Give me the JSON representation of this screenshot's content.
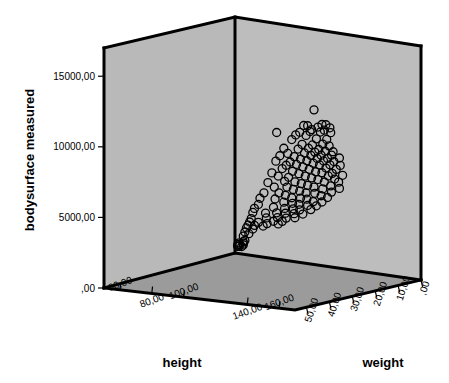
{
  "chart_data": {
    "type": "scatter",
    "title": "",
    "subtitle": "",
    "projection": "3d",
    "xlabel": "height",
    "ylabel": "weight",
    "zlabel": "bodysurface measured",
    "axes": {
      "x": {
        "name": "height",
        "tick_labels": [
          "60,00",
          "80,00",
          "100,00",
          "140,00",
          "160,00"
        ],
        "tick_values": [
          60,
          80,
          100,
          140,
          160
        ],
        "range": [
          50,
          170
        ],
        "label_rotation_deg": -20,
        "staggered": true
      },
      "y": {
        "name": "weight",
        "tick_labels": [
          "50,00",
          "40,00",
          "30,00",
          "20,00",
          "10,00",
          ",00"
        ],
        "tick_values": [
          50,
          40,
          30,
          20,
          10,
          0
        ],
        "range": [
          55,
          0
        ],
        "label_rotation_deg": -72
      },
      "z": {
        "name": "bodysurface measured",
        "tick_labels": [
          "15000,00",
          "10000,00",
          "5000,00",
          ",00"
        ],
        "tick_values": [
          15000,
          10000,
          5000,
          0
        ],
        "range": [
          0,
          17000
        ],
        "label_rotation_deg": 0
      }
    },
    "grid": false,
    "legend": null,
    "marker": {
      "shape": "open-circle",
      "radius_px": 4,
      "stroke": "#000000",
      "fill": "none"
    },
    "colors": {
      "left_wall": "#b9b9b9",
      "right_wall": "#bdbdbd",
      "floor": "#9b9b9b",
      "frame": "#000000",
      "text": "#000000",
      "background": "#ffffff"
    },
    "n_points": 149,
    "points": [
      {
        "height": 158,
        "weight": 39,
        "bodysurface": 13300
      },
      {
        "height": 151,
        "weight": 50,
        "bodysurface": 12100
      },
      {
        "height": 156,
        "weight": 42,
        "bodysurface": 12300
      },
      {
        "height": 157,
        "weight": 41,
        "bodysurface": 12250
      },
      {
        "height": 160,
        "weight": 37,
        "bodysurface": 12200
      },
      {
        "height": 161,
        "weight": 36,
        "bodysurface": 12150
      },
      {
        "height": 159,
        "weight": 38,
        "bodysurface": 12050
      },
      {
        "height": 158,
        "weight": 40,
        "bodysurface": 11950
      },
      {
        "height": 162,
        "weight": 35,
        "bodysurface": 11900
      },
      {
        "height": 155,
        "weight": 43,
        "bodysurface": 11850
      },
      {
        "height": 157,
        "weight": 40,
        "bodysurface": 11800
      },
      {
        "height": 160,
        "weight": 36,
        "bodysurface": 11750
      },
      {
        "height": 154,
        "weight": 44,
        "bodysurface": 11700
      },
      {
        "height": 159,
        "weight": 37,
        "bodysurface": 11650
      },
      {
        "height": 156,
        "weight": 41,
        "bodysurface": 11550
      },
      {
        "height": 161,
        "weight": 34,
        "bodysurface": 11500
      },
      {
        "height": 153,
        "weight": 45,
        "bodysurface": 11400
      },
      {
        "height": 158,
        "weight": 38,
        "bodysurface": 11200
      },
      {
        "height": 160,
        "weight": 35,
        "bodysurface": 11050
      },
      {
        "height": 155,
        "weight": 42,
        "bodysurface": 10950
      },
      {
        "height": 151,
        "weight": 47,
        "bodysurface": 10850
      },
      {
        "height": 157,
        "weight": 39,
        "bodysurface": 10800
      },
      {
        "height": 159,
        "weight": 36,
        "bodysurface": 10750
      },
      {
        "height": 154,
        "weight": 43,
        "bodysurface": 10650
      },
      {
        "height": 156,
        "weight": 40,
        "bodysurface": 10600
      },
      {
        "height": 160,
        "weight": 34,
        "bodysurface": 10550
      },
      {
        "height": 152,
        "weight": 46,
        "bodysurface": 10450
      },
      {
        "height": 158,
        "weight": 37,
        "bodysurface": 10400
      },
      {
        "height": 150,
        "weight": 48,
        "bodysurface": 10350
      },
      {
        "height": 155,
        "weight": 41,
        "bodysurface": 10300
      },
      {
        "height": 157,
        "weight": 38,
        "bodysurface": 10250
      },
      {
        "height": 159,
        "weight": 35,
        "bodysurface": 10200
      },
      {
        "height": 153,
        "weight": 44,
        "bodysurface": 10150
      },
      {
        "height": 161,
        "weight": 33,
        "bodysurface": 10100
      },
      {
        "height": 156,
        "weight": 39,
        "bodysurface": 10050
      },
      {
        "height": 149,
        "weight": 49,
        "bodysurface": 10000
      },
      {
        "height": 158,
        "weight": 36,
        "bodysurface": 9950
      },
      {
        "height": 154,
        "weight": 42,
        "bodysurface": 9900
      },
      {
        "height": 160,
        "weight": 33,
        "bodysurface": 9850
      },
      {
        "height": 152,
        "weight": 45,
        "bodysurface": 9800
      },
      {
        "height": 157,
        "weight": 37,
        "bodysurface": 9750
      },
      {
        "height": 155,
        "weight": 40,
        "bodysurface": 9700
      },
      {
        "height": 159,
        "weight": 34,
        "bodysurface": 9650
      },
      {
        "height": 151,
        "weight": 46,
        "bodysurface": 9600
      },
      {
        "height": 162,
        "weight": 31,
        "bodysurface": 9580
      },
      {
        "height": 153,
        "weight": 43,
        "bodysurface": 9550
      },
      {
        "height": 158,
        "weight": 35,
        "bodysurface": 9500
      },
      {
        "height": 156,
        "weight": 38,
        "bodysurface": 9450
      },
      {
        "height": 150,
        "weight": 47,
        "bodysurface": 9400
      },
      {
        "height": 160,
        "weight": 32,
        "bodysurface": 9350
      },
      {
        "height": 154,
        "weight": 41,
        "bodysurface": 9300
      },
      {
        "height": 157,
        "weight": 36,
        "bodysurface": 9250
      },
      {
        "height": 148,
        "weight": 50,
        "bodysurface": 9200
      },
      {
        "height": 159,
        "weight": 33,
        "bodysurface": 9150
      },
      {
        "height": 152,
        "weight": 44,
        "bodysurface": 9100
      },
      {
        "height": 155,
        "weight": 39,
        "bodysurface": 9050
      },
      {
        "height": 161,
        "weight": 30,
        "bodysurface": 9000
      },
      {
        "height": 158,
        "weight": 34,
        "bodysurface": 8950
      },
      {
        "height": 149,
        "weight": 48,
        "bodysurface": 8900
      },
      {
        "height": 153,
        "weight": 42,
        "bodysurface": 8850
      },
      {
        "height": 156,
        "weight": 37,
        "bodysurface": 8800
      },
      {
        "height": 160,
        "weight": 31,
        "bodysurface": 8750
      },
      {
        "height": 151,
        "weight": 45,
        "bodysurface": 8700
      },
      {
        "height": 157,
        "weight": 35,
        "bodysurface": 8650
      },
      {
        "height": 154,
        "weight": 40,
        "bodysurface": 8600
      },
      {
        "height": 147,
        "weight": 51,
        "bodysurface": 8550
      },
      {
        "height": 159,
        "weight": 32,
        "bodysurface": 8500
      },
      {
        "height": 150,
        "weight": 46,
        "bodysurface": 8450
      },
      {
        "height": 155,
        "weight": 38,
        "bodysurface": 8400
      },
      {
        "height": 158,
        "weight": 33,
        "bodysurface": 8350
      },
      {
        "height": 152,
        "weight": 43,
        "bodysurface": 8300
      },
      {
        "height": 161,
        "weight": 29,
        "bodysurface": 8250
      },
      {
        "height": 156,
        "weight": 36,
        "bodysurface": 8200
      },
      {
        "height": 148,
        "weight": 49,
        "bodysurface": 8150
      },
      {
        "height": 153,
        "weight": 41,
        "bodysurface": 8100
      },
      {
        "height": 159,
        "weight": 31,
        "bodysurface": 8050
      },
      {
        "height": 150,
        "weight": 45,
        "bodysurface": 8000
      },
      {
        "height": 157,
        "weight": 34,
        "bodysurface": 7950
      },
      {
        "height": 154,
        "weight": 39,
        "bodysurface": 7900
      },
      {
        "height": 146,
        "weight": 52,
        "bodysurface": 7850
      },
      {
        "height": 160,
        "weight": 30,
        "bodysurface": 7800
      },
      {
        "height": 151,
        "weight": 43,
        "bodysurface": 7750
      },
      {
        "height": 155,
        "weight": 37,
        "bodysurface": 7700
      },
      {
        "height": 148,
        "weight": 47,
        "bodysurface": 7650
      },
      {
        "height": 158,
        "weight": 32,
        "bodysurface": 7600
      },
      {
        "height": 152,
        "weight": 41,
        "bodysurface": 7550
      },
      {
        "height": 145,
        "weight": 53,
        "bodysurface": 7500
      },
      {
        "height": 156,
        "weight": 34,
        "bodysurface": 7450
      },
      {
        "height": 149,
        "weight": 45,
        "bodysurface": 7400
      },
      {
        "height": 153,
        "weight": 39,
        "bodysurface": 7350
      },
      {
        "height": 159,
        "weight": 29,
        "bodysurface": 7300
      },
      {
        "height": 147,
        "weight": 48,
        "bodysurface": 7250
      },
      {
        "height": 154,
        "weight": 36,
        "bodysurface": 7200
      },
      {
        "height": 150,
        "weight": 43,
        "bodysurface": 7150
      },
      {
        "height": 157,
        "weight": 31,
        "bodysurface": 7100
      },
      {
        "height": 144,
        "weight": 53,
        "bodysurface": 7050
      },
      {
        "height": 151,
        "weight": 40,
        "bodysurface": 7000
      },
      {
        "height": 155,
        "weight": 34,
        "bodysurface": 6950
      },
      {
        "height": 148,
        "weight": 45,
        "bodysurface": 6900
      },
      {
        "height": 152,
        "weight": 38,
        "bodysurface": 6850
      },
      {
        "height": 143,
        "weight": 54,
        "bodysurface": 6800
      },
      {
        "height": 156,
        "weight": 32,
        "bodysurface": 6750
      },
      {
        "height": 149,
        "weight": 42,
        "bodysurface": 6700
      },
      {
        "height": 146,
        "weight": 48,
        "bodysurface": 6650
      },
      {
        "height": 153,
        "weight": 36,
        "bodysurface": 6600
      },
      {
        "height": 150,
        "weight": 40,
        "bodysurface": 6550
      },
      {
        "height": 142,
        "weight": 54,
        "bodysurface": 6500
      },
      {
        "height": 154,
        "weight": 33,
        "bodysurface": 6450
      },
      {
        "height": 147,
        "weight": 44,
        "bodysurface": 6400
      },
      {
        "height": 151,
        "weight": 37,
        "bodysurface": 6350
      },
      {
        "height": 144,
        "weight": 50,
        "bodysurface": 6300
      },
      {
        "height": 148,
        "weight": 41,
        "bodysurface": 6250
      },
      {
        "height": 152,
        "weight": 34,
        "bodysurface": 6200
      },
      {
        "height": 145,
        "weight": 46,
        "bodysurface": 6150
      },
      {
        "height": 149,
        "weight": 39,
        "bodysurface": 6100
      },
      {
        "height": 141,
        "weight": 54,
        "bodysurface": 6050
      },
      {
        "height": 146,
        "weight": 43,
        "bodysurface": 6000
      },
      {
        "height": 150,
        "weight": 35,
        "bodysurface": 5950
      },
      {
        "height": 143,
        "weight": 49,
        "bodysurface": 5900
      },
      {
        "height": 147,
        "weight": 40,
        "bodysurface": 5850
      },
      {
        "height": 140,
        "weight": 54,
        "bodysurface": 5800
      },
      {
        "height": 144,
        "weight": 45,
        "bodysurface": 5750
      },
      {
        "height": 148,
        "weight": 37,
        "bodysurface": 5700
      },
      {
        "height": 141,
        "weight": 51,
        "bodysurface": 5650
      },
      {
        "height": 145,
        "weight": 42,
        "bodysurface": 5600
      },
      {
        "height": 139,
        "weight": 54,
        "bodysurface": 5560
      },
      {
        "height": 143,
        "weight": 46,
        "bodysurface": 5530
      },
      {
        "height": 146,
        "weight": 39,
        "bodysurface": 5500
      },
      {
        "height": 140,
        "weight": 52,
        "bodysurface": 5470
      },
      {
        "height": 142,
        "weight": 48,
        "bodysurface": 5440
      },
      {
        "height": 144,
        "weight": 43,
        "bodysurface": 5400
      },
      {
        "height": 138,
        "weight": 54,
        "bodysurface": 5350
      },
      {
        "height": 141,
        "weight": 49,
        "bodysurface": 5300
      },
      {
        "height": 143,
        "weight": 44,
        "bodysurface": 5250
      },
      {
        "height": 139,
        "weight": 52,
        "bodysurface": 5200
      },
      {
        "height": 137,
        "weight": 54,
        "bodysurface": 5050
      },
      {
        "height": 138,
        "weight": 53,
        "bodysurface": 4900
      },
      {
        "height": 136,
        "weight": 54,
        "bodysurface": 4750
      },
      {
        "height": 137,
        "weight": 54,
        "bodysurface": 4450
      },
      {
        "height": 136,
        "weight": 54,
        "bodysurface": 4350
      },
      {
        "height": 135,
        "weight": 55,
        "bodysurface": 4300
      },
      {
        "height": 136,
        "weight": 54,
        "bodysurface": 4250
      },
      {
        "height": 135,
        "weight": 55,
        "bodysurface": 4200
      },
      {
        "height": 134,
        "weight": 55,
        "bodysurface": 4150
      },
      {
        "height": 136,
        "weight": 54,
        "bodysurface": 4120
      },
      {
        "height": 135,
        "weight": 55,
        "bodysurface": 4080
      },
      {
        "height": 134,
        "weight": 55,
        "bodysurface": 4040
      },
      {
        "height": 135,
        "weight": 54,
        "bodysurface": 4000
      }
    ]
  },
  "geometry": {
    "corner_top_center": [
      235,
      17
    ],
    "corner_top_left": [
      104,
      48
    ],
    "corner_top_right": [
      421,
      46
    ],
    "corner_inner_bottom": [
      235,
      253
    ],
    "corner_bottom_left": [
      104,
      288
    ],
    "corner_bottom_right": [
      421,
      280
    ],
    "corner_front": [
      295,
      310
    ]
  }
}
